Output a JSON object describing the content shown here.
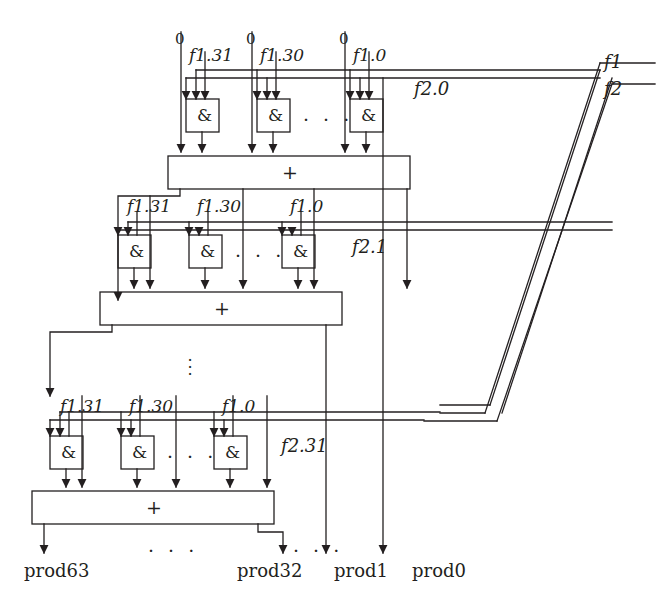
{
  "figure": {
    "stroke_color": "#231f20",
    "background": "#ffffff"
  },
  "buses": {
    "f1_label": "f1",
    "f2_label": "f2"
  },
  "rows": [
    {
      "id": "row-0",
      "zero_labels": [
        "0",
        "0",
        "0"
      ],
      "operand_labels": [
        "f1.31",
        "f1.30",
        "f1.0"
      ],
      "gate_label": "&",
      "gate_ellipsis": "· · ·",
      "adder_label": "+",
      "select_label": "f2.0"
    },
    {
      "id": "row-1",
      "zero_labels": [],
      "operand_labels": [
        "f1.31",
        "f1.30",
        "f1.0"
      ],
      "gate_label": "&",
      "gate_ellipsis": "· · ·",
      "adder_label": "+",
      "select_label": "f2.1"
    },
    {
      "id": "row-n",
      "zero_labels": [],
      "operand_labels": [
        "f1.31",
        "f1.30",
        "f1.0"
      ],
      "gate_label": "&",
      "gate_ellipsis": "· · ·",
      "adder_label": "+",
      "select_label": "f2.31"
    }
  ],
  "row_ellipsis": "⋮",
  "outputs": {
    "ellipsis_left": "· · ·",
    "ellipsis_right": "· · ·",
    "labels": [
      "prod63",
      "prod32",
      "prod1",
      "prod0"
    ]
  }
}
